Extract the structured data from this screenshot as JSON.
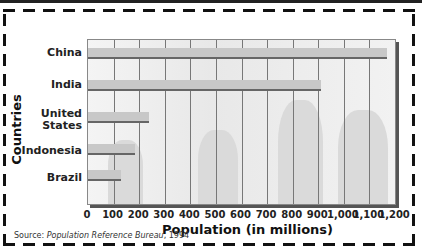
{
  "chart_data": {
    "type": "bar",
    "orientation": "horizontal",
    "categories": [
      "China",
      "India",
      "United States",
      "Indonesia",
      "Brazil"
    ],
    "values": [
      1170,
      910,
      240,
      185,
      130
    ],
    "xlabel": "Population (in millions)",
    "ylabel": "Countries",
    "xlim": [
      0,
      1200
    ],
    "xticks": [
      "0",
      "100",
      "200",
      "300",
      "400",
      "500",
      "600",
      "700",
      "800",
      "900",
      "1,000",
      "1,100",
      "1,200"
    ],
    "grid": true,
    "source_prefix": "Source: ",
    "source_title": "Population Reference Bureau",
    "source_year": ", 1994"
  },
  "labels": {
    "cat0": "China",
    "cat1": "India",
    "cat2a": "United",
    "cat2b": "States",
    "cat3": "Indonesia",
    "cat4": "Brazil"
  }
}
